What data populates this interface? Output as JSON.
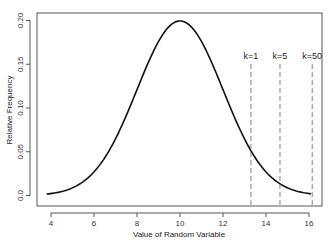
{
  "chart_data": {
    "type": "line",
    "title": "",
    "xlabel": "Value of Random Variable",
    "ylabel": "Relative Frequency",
    "xlim": [
      3.65,
      16.75
    ],
    "ylim": [
      -0.0025,
      0.2075
    ],
    "xticks": [
      4,
      6,
      8,
      10,
      12,
      14,
      16
    ],
    "xtick_labels": [
      "4",
      "6",
      "8",
      "10",
      "12",
      "14",
      "16"
    ],
    "yticks": [
      0.0,
      0.05,
      0.1,
      0.15,
      0.2
    ],
    "ytick_labels": [
      "0.0",
      "0.05",
      "0.10",
      "0.15",
      "0.20"
    ],
    "grid": false,
    "legend": null,
    "series": [
      {
        "name": "Normal density (mean 10, sd 2)",
        "distribution": {
          "mean": 10,
          "sd": 2
        },
        "x_range": [
          3.8,
          16.1
        ],
        "x": [
          3.8,
          4.5,
          5,
          5.5,
          6,
          6.5,
          7,
          7.5,
          8,
          8.5,
          9,
          9.5,
          10,
          10.5,
          11,
          11.5,
          12,
          12.5,
          13,
          13.5,
          14,
          14.5,
          15,
          15.5,
          16,
          16.1
        ],
        "values": [
          0.0018,
          0.0045,
          0.0088,
          0.0158,
          0.027,
          0.0431,
          0.0648,
          0.0913,
          0.121,
          0.1506,
          0.176,
          0.1933,
          0.1995,
          0.1933,
          0.176,
          0.1506,
          0.121,
          0.0913,
          0.0648,
          0.0431,
          0.027,
          0.0158,
          0.0088,
          0.0045,
          0.0022,
          0.0019
        ]
      }
    ],
    "vertical_lines": [
      {
        "label": "k=1",
        "x": 13.3,
        "style": "dashed"
      },
      {
        "label": "k=5",
        "x": 14.65,
        "style": "dashed"
      },
      {
        "label": "k=50",
        "x": 16.15,
        "style": "dashed"
      }
    ]
  }
}
